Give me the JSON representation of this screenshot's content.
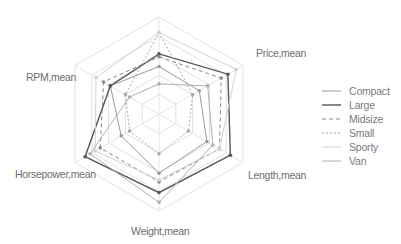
{
  "chart_data": {
    "type": "radar",
    "title": "",
    "axes": [
      "",
      "Price,mean",
      "Length,mean",
      "Weight,mean",
      "Horsepower,mean",
      "RPM,mean"
    ],
    "range": [
      0,
      1
    ],
    "rings": 5,
    "grid": true,
    "legend_position": "right",
    "series": [
      {
        "name": "Compact",
        "color": "#9a9a9a",
        "dash": "",
        "width": 1,
        "values": [
          0.49,
          0.48,
          0.57,
          0.61,
          0.45,
          0.58
        ]
      },
      {
        "name": "Large",
        "color": "#555555",
        "dash": "",
        "width": 1.4,
        "values": [
          0.62,
          0.82,
          0.85,
          0.81,
          0.88,
          0.58
        ]
      },
      {
        "name": "Midsize",
        "color": "#8a8a8a",
        "dash": "4,3",
        "width": 1,
        "values": [
          0.59,
          0.74,
          0.72,
          0.7,
          0.7,
          0.66
        ]
      },
      {
        "name": "Small",
        "color": "#a8a8a8",
        "dash": "2,2",
        "width": 1,
        "values": [
          0.84,
          0.4,
          0.35,
          0.41,
          0.35,
          0.4
        ]
      },
      {
        "name": "Sporty",
        "color": "#d2d2d2",
        "dash": "",
        "width": 1,
        "values": [
          0.84,
          0.92,
          0.72,
          0.68,
          0.76,
          0.75
        ]
      },
      {
        "name": "Van",
        "color": "#b0b0b0",
        "dash": "",
        "width": 1,
        "values": [
          0.31,
          0.58,
          0.64,
          0.91,
          0.82,
          0.35
        ]
      }
    ]
  },
  "legend": {
    "items": [
      {
        "label": "Compact"
      },
      {
        "label": "Large"
      },
      {
        "label": "Midsize"
      },
      {
        "label": "Small"
      },
      {
        "label": "Sporty"
      },
      {
        "label": "Van"
      }
    ]
  },
  "labels": {
    "price": "Price,mean",
    "length": "Length,mean",
    "weight": "Weight,mean",
    "horsepower": "Horsepower,mean",
    "rpm": "RPM,mean"
  }
}
